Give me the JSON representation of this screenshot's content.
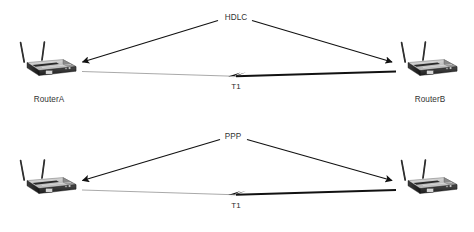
{
  "diagram": {
    "background_color": "#ffffff",
    "line_color": "#1a1a1a",
    "thin_line_color": "#8f8f8f",
    "text_color": "#333333",
    "router_top_color": "#cfcfcf",
    "router_side_color": "#262626",
    "rows": [
      {
        "id": "hdlc-row",
        "protocol_label": "HDLC",
        "link_label": "T1",
        "link_type": "serial-wan",
        "left_device": {
          "name": "router-a",
          "label": "RouterA",
          "icon": "wireless-router-icon",
          "antennas": 2
        },
        "right_device": {
          "name": "router-b",
          "label": "RouterB",
          "icon": "wireless-router-icon",
          "antennas": 2
        }
      },
      {
        "id": "ppp-row",
        "protocol_label": "PPP",
        "link_label": "T1",
        "link_type": "serial-wan",
        "left_device": {
          "name": "router-c",
          "label": "",
          "icon": "wireless-router-icon",
          "antennas": 2
        },
        "right_device": {
          "name": "router-d",
          "label": "",
          "icon": "wireless-router-icon",
          "antennas": 2
        }
      }
    ]
  }
}
